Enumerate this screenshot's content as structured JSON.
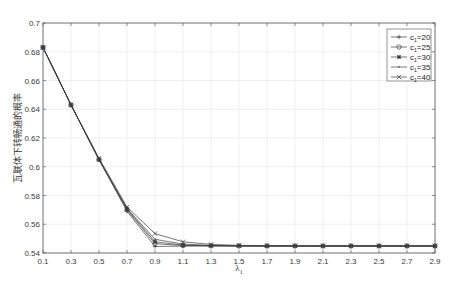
{
  "chart_data": {
    "type": "line",
    "title": "",
    "xlabel": "λ1",
    "xlabel_main": "λ",
    "xlabel_sub": "1",
    "ylabel": "瓦联体下转畅通的概率",
    "xlim": [
      0.1,
      2.9
    ],
    "ylim": [
      0.54,
      0.7
    ],
    "grid": true,
    "legend_position": "upper right",
    "x_ticks": [
      "0.1",
      "0.3",
      "0.5",
      "0.7",
      "0.9",
      "1.1",
      "1.3",
      "1.5",
      "1.7",
      "1.9",
      "2.1",
      "2.3",
      "2.5",
      "2.7",
      "2.9"
    ],
    "y_ticks": [
      "0.54",
      "0.56",
      "0.58",
      "0.6",
      "0.62",
      "0.64",
      "0.66",
      "0.68",
      "0.7"
    ],
    "x": [
      0.1,
      0.3,
      0.5,
      0.7,
      0.9,
      1.1,
      1.3,
      1.5,
      1.7,
      1.9,
      2.1,
      2.3,
      2.5,
      2.7,
      2.9
    ],
    "series": [
      {
        "name": "c1=20",
        "label_main": "c",
        "label_sub": "1",
        "label_rest": "=20",
        "marker": "plus",
        "values": [
          0.683,
          0.643,
          0.605,
          0.569,
          0.5445,
          0.5448,
          0.5449,
          0.5449,
          0.5449,
          0.5449,
          0.5449,
          0.5449,
          0.5449,
          0.5449,
          0.5449
        ]
      },
      {
        "name": "c1=25",
        "label_main": "c",
        "label_sub": "1",
        "label_rest": "=25",
        "marker": "circle",
        "values": [
          0.683,
          0.643,
          0.605,
          0.57,
          0.5465,
          0.5452,
          0.545,
          0.5449,
          0.5449,
          0.5449,
          0.5449,
          0.5449,
          0.5449,
          0.5449,
          0.5449
        ]
      },
      {
        "name": "c1=30",
        "label_main": "c",
        "label_sub": "1",
        "label_rest": "=30",
        "marker": "asterisk",
        "values": [
          0.683,
          0.643,
          0.605,
          0.5705,
          0.5478,
          0.5455,
          0.5451,
          0.545,
          0.5449,
          0.5449,
          0.5449,
          0.5449,
          0.5449,
          0.5449,
          0.5449
        ]
      },
      {
        "name": "c1=35",
        "label_main": "c",
        "label_sub": "1",
        "label_rest": "=35",
        "marker": "point",
        "values": [
          0.683,
          0.643,
          0.605,
          0.571,
          0.5495,
          0.5462,
          0.5453,
          0.545,
          0.5449,
          0.5449,
          0.5449,
          0.5449,
          0.5449,
          0.5449,
          0.5449
        ]
      },
      {
        "name": "c1=40",
        "label_main": "c",
        "label_sub": "1",
        "label_rest": "=40",
        "marker": "cross",
        "values": [
          0.683,
          0.643,
          0.606,
          0.572,
          0.5535,
          0.5478,
          0.546,
          0.5453,
          0.5451,
          0.545,
          0.5449,
          0.5449,
          0.5449,
          0.5449,
          0.5449
        ]
      }
    ]
  },
  "colors": {
    "axis": "#4d4d4d",
    "grid": "#e6e6e6",
    "line": "#3c3c3c",
    "background": "#ffffff"
  }
}
